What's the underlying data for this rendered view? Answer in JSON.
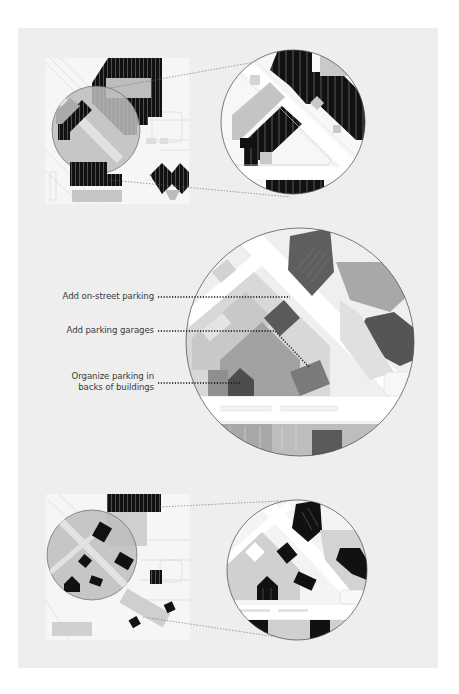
{
  "figure": {
    "background": "#eeeeee",
    "page_background": "#ffffff",
    "colors": {
      "parking": "#111111",
      "building": "#c8c8c8",
      "street": "#ffffff",
      "block": "#e6e6e6",
      "highlight_circle": "#bdbdbd",
      "garage_tint": "#6e6e6e",
      "leader_line": "#222222"
    }
  },
  "panels": [
    {
      "id": "top",
      "description": "Existing condition: surface parking lots",
      "magnified": true
    },
    {
      "id": "middle",
      "description": "Proposed parking strategies",
      "magnified": true
    },
    {
      "id": "bottom",
      "description": "Result: parking organized behind buildings",
      "magnified": true
    }
  ],
  "annotations": [
    {
      "id": "on-street",
      "text": "Add on-street parking"
    },
    {
      "id": "garages",
      "text": "Add parking garages"
    },
    {
      "id": "backs",
      "line1": "Organize parking in",
      "line2": "backs of buildings"
    }
  ]
}
